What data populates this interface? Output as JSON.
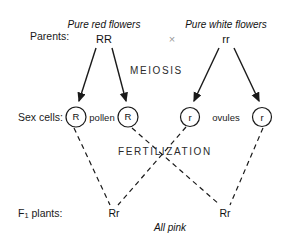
{
  "diagram": {
    "line_color": "#1a1a1a",
    "cross_symbol_color": "#9a9a9a",
    "rows": {
      "parents_label": "Parents:",
      "sex_cells_label": "Sex cells:",
      "f1_label_prefix": "F",
      "f1_label_subscript": "1",
      "f1_label_suffix": " plants:"
    },
    "parents": [
      {
        "phenotype": "Pure red flowers",
        "genotype": "RR"
      },
      {
        "phenotype": "Pure white flowers",
        "genotype": "rr"
      }
    ],
    "cross_symbol": "×",
    "stages": {
      "meiosis": "MEIOSIS",
      "fertilization": "FERTILIZATION"
    },
    "gametes": [
      {
        "allele": "R",
        "type": "pollen"
      },
      {
        "allele": "R",
        "type": "pollen"
      },
      {
        "allele": "r",
        "type": "ovules"
      },
      {
        "allele": "r",
        "type": "ovules"
      }
    ],
    "gamete_group_labels": {
      "pollen": "pollen",
      "ovules": "ovules"
    },
    "offspring": [
      {
        "genotype": "Rr"
      },
      {
        "genotype": "Rr"
      }
    ],
    "caption": "All pink"
  }
}
